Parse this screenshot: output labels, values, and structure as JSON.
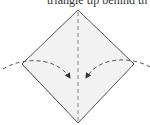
{
  "caption": {
    "text": "triangle tip behind th"
  },
  "diagram": {
    "type": "origami-fold-step",
    "shape": "diamond (square base, point up)",
    "fold_lines": [
      {
        "name": "center-vertical-valley-fold",
        "style": "dashed"
      }
    ],
    "arrows": [
      {
        "name": "left-flap-fold-arrow",
        "direction": "from left corner curving to center"
      },
      {
        "name": "right-flap-fold-arrow",
        "direction": "from right corner curving to center"
      }
    ],
    "colors": {
      "paper_fill": "#f2f2f2",
      "outline": "#444444",
      "fold_line": "#666666",
      "arrow": "#333333",
      "caption_text": "#333333"
    }
  }
}
